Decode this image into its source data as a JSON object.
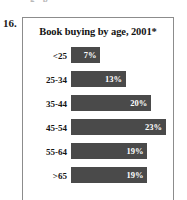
{
  "question_number": "16.",
  "top_sliver_text": "g p",
  "chart_data": {
    "type": "bar",
    "orientation": "horizontal",
    "title": "Book buying by age, 2001*",
    "xlabel": "",
    "ylabel": "",
    "categories": [
      "<25",
      "25-34",
      "35-44",
      "45-54",
      "55-64",
      ">65"
    ],
    "values": [
      7,
      13,
      20,
      23,
      19,
      19
    ],
    "value_labels": [
      "7%",
      "13%",
      "20%",
      "23%",
      "19%",
      "19%"
    ],
    "units": "percent",
    "xlim": [
      0,
      25
    ],
    "grid": false,
    "legend": "none",
    "bar_color": "#4a4a4a",
    "value_label_color": "#ffffff",
    "footnote_marker": "*"
  },
  "bars": [
    {
      "label": "<25",
      "value_label": "7%",
      "width_pct": 30
    },
    {
      "label": "25-34",
      "value_label": "13%",
      "width_pct": 56
    },
    {
      "label": "35-44",
      "value_label": "20%",
      "width_pct": 82
    },
    {
      "label": "45-54",
      "value_label": "23%",
      "width_pct": 97
    },
    {
      "label": "55-64",
      "value_label": "19%",
      "width_pct": 78
    },
    {
      "label": ">65",
      "value_label": "19%",
      "width_pct": 78
    }
  ]
}
